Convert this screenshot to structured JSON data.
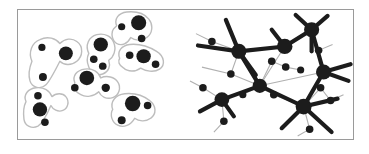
{
  "figure": {
    "title": "",
    "frame": {
      "border_color": "#9a9a9a",
      "background_color": "#ffffff",
      "x": 17,
      "y": 9,
      "width": 337,
      "height": 131
    },
    "panels": [
      {
        "id": "clusters",
        "name": "clustered-nodes-panel",
        "caption": ""
      },
      {
        "id": "network",
        "name": "network-graph-panel",
        "caption": ""
      }
    ]
  },
  "style": {
    "node_color": "#1c1c1c",
    "blob_stroke_color": "#bdbdbd",
    "blob_fill_color": "#ffffff",
    "backbone_edge_color": "#1c1c1c",
    "leaf_edge_color": "#b0b0b0",
    "blob_stroke_width": 1.4,
    "backbone_edge_width": 4.2,
    "leaf_edge_width": 1.1
  },
  "chart_data": {
    "type": "diagram",
    "title": "",
    "subtitle": "",
    "xlabel": "",
    "ylabel": "",
    "panels": [
      {
        "id": "clusters",
        "label": "",
        "description": "Nodes grouped into gray outlined cluster blobs",
        "viewbox": [
          0,
          0,
          168,
          131
        ],
        "clusters": [
          {
            "id": "c1",
            "outline": "M 14,52 C 10,43 14,33 22,30 C 30,26 38,29 42,34 C 47,29 54,28 59,32 C 66,37 65,47 59,52 C 53,57 46,56 42,52 C 38,60 32,72 28,76 C 23,81 14,79 12,72 C 10,65 12,57 14,52 Z",
            "nodes": [
              {
                "cx": 24,
                "cy": 38,
                "r": 3.6
              },
              {
                "cx": 48,
                "cy": 44,
                "r": 7.0
              },
              {
                "cx": 25,
                "cy": 68,
                "r": 4.0
              }
            ]
          },
          {
            "id": "c2",
            "outline": "M 71,44 C 67,36 71,27 79,25 C 87,23 94,27 96,33 C 99,40 96,48 91,51 C 93,57 91,63 85,65 C 79,67 73,64 71,58 C 69,53 69,48 71,44 Z",
            "nodes": [
              {
                "cx": 83,
                "cy": 35,
                "r": 7.2
              },
              {
                "cx": 76,
                "cy": 50,
                "r": 3.8
              },
              {
                "cx": 85,
                "cy": 57,
                "r": 3.8
              }
            ]
          },
          {
            "id": "c3",
            "outline": "M 99,16 C 96,9 101,3 109,2 C 119,1 127,4 131,9 C 136,15 135,24 129,28 C 124,32 117,31 113,28 C 110,34 104,37 99,34 C 94,31 93,23 96,19 Z",
            "nodes": [
              {
                "cx": 121,
                "cy": 13,
                "r": 7.6
              },
              {
                "cx": 104,
                "cy": 17,
                "r": 3.6
              },
              {
                "cx": 124,
                "cy": 29,
                "r": 3.8
              }
            ]
          },
          {
            "id": "c4",
            "outline": "M 102,49 C 99,42 104,36 112,35 C 122,34 131,37 139,42 C 147,47 148,56 142,60 C 136,64 128,62 123,59 C 118,63 110,63 106,59 C 101,56 100,52 102,49 Z",
            "nodes": [
              {
                "cx": 112,
                "cy": 46,
                "r": 3.8
              },
              {
                "cx": 126,
                "cy": 47,
                "r": 7.2
              },
              {
                "cx": 138,
                "cy": 55,
                "r": 3.8
              }
            ]
          },
          {
            "id": "c5",
            "outline": "M 57,74 C 54,67 59,61 67,60 C 75,59 81,63 83,69 C 89,66 97,68 100,73 C 104,79 101,87 95,89 C 89,91 83,88 81,83 C 76,88 68,89 63,86 C 57,83 55,78 57,74 Z",
            "nodes": [
              {
                "cx": 69,
                "cy": 69,
                "r": 7.4
              },
              {
                "cx": 57,
                "cy": 79,
                "r": 3.8
              },
              {
                "cx": 88,
                "cy": 79,
                "r": 4.2
              }
            ]
          },
          {
            "id": "c6",
            "outline": "M 8,93 C 5,86 10,80 18,79 C 26,78 32,82 34,88 C 38,84 45,84 48,88 C 52,93 50,100 45,102 C 40,104 35,101 33,97 C 30,104 25,115 20,118 C 14,121 7,118 6,111 C 5,103 6,97 8,93 Z",
            "nodes": [
              {
                "cx": 20,
                "cy": 87,
                "r": 3.8
              },
              {
                "cx": 22,
                "cy": 101,
                "r": 7.2
              },
              {
                "cx": 27,
                "cy": 114,
                "r": 3.8
              }
            ]
          },
          {
            "id": "c7",
            "outline": "M 95,101 C 92,93 98,86 107,85 C 117,84 126,87 132,92 C 139,97 139,106 133,110 C 128,114 121,113 117,110 C 113,117 106,120 100,117 C 94,114 92,106 95,101 Z",
            "nodes": [
              {
                "cx": 115,
                "cy": 95,
                "r": 7.8
              },
              {
                "cx": 130,
                "cy": 97,
                "r": 3.8
              },
              {
                "cx": 104,
                "cy": 112,
                "r": 4.0
              }
            ]
          }
        ]
      },
      {
        "id": "network",
        "label": "",
        "description": "Backbone network of large hub nodes with thin gray leaf edges",
        "viewbox": [
          0,
          0,
          168,
          131
        ],
        "hub_nodes": [
          {
            "id": "h1",
            "cx": 53,
            "cy": 42,
            "r": 7.6
          },
          {
            "id": "h2",
            "cx": 99,
            "cy": 37,
            "r": 7.8
          },
          {
            "id": "h3",
            "cx": 126,
            "cy": 20,
            "r": 7.6
          },
          {
            "id": "h4",
            "cx": 138,
            "cy": 63,
            "r": 7.6
          },
          {
            "id": "h5",
            "cx": 74,
            "cy": 77,
            "r": 7.2
          },
          {
            "id": "h6",
            "cx": 36,
            "cy": 91,
            "r": 7.4
          },
          {
            "id": "h7",
            "cx": 118,
            "cy": 98,
            "r": 8.0
          }
        ],
        "leaf_nodes": [
          {
            "id": "l1",
            "cx": 26,
            "cy": 32,
            "r": 3.8
          },
          {
            "id": "l2",
            "cx": 86,
            "cy": 52,
            "r": 3.8
          },
          {
            "id": "l3",
            "cx": 100,
            "cy": 58,
            "r": 3.8
          },
          {
            "id": "l4",
            "cx": 115,
            "cy": 61,
            "r": 3.6
          },
          {
            "id": "l5",
            "cx": 133,
            "cy": 41,
            "r": 3.8
          },
          {
            "id": "l6",
            "cx": 45,
            "cy": 65,
            "r": 3.8
          },
          {
            "id": "l7",
            "cx": 17,
            "cy": 79,
            "r": 3.8
          },
          {
            "id": "l8",
            "cx": 57,
            "cy": 86,
            "r": 3.6
          },
          {
            "id": "l9",
            "cx": 88,
            "cy": 86,
            "r": 3.8
          },
          {
            "id": "l10",
            "cx": 38,
            "cy": 113,
            "r": 3.8
          },
          {
            "id": "l11",
            "cx": 135,
            "cy": 79,
            "r": 3.8
          },
          {
            "id": "l12",
            "cx": 145,
            "cy": 92,
            "r": 3.8
          },
          {
            "id": "l13",
            "cx": 124,
            "cy": 121,
            "r": 3.8
          }
        ],
        "backbone_edges": [
          [
            "h1",
            "h2"
          ],
          [
            "h2",
            "h3"
          ],
          [
            "h3",
            "h4"
          ],
          [
            "h1",
            "h5"
          ],
          [
            "h5",
            "h6"
          ],
          [
            "h5",
            "h7"
          ],
          [
            "h4",
            "h7"
          ]
        ],
        "backbone_spurs": [
          {
            "from": "h1",
            "x": 12,
            "y": 36
          },
          {
            "from": "h1",
            "x": 40,
            "y": 10
          },
          {
            "from": "h1",
            "x": 70,
            "y": 66
          },
          {
            "from": "h2",
            "x": 86,
            "y": 20
          },
          {
            "from": "h3",
            "x": 110,
            "y": 5
          },
          {
            "from": "h3",
            "x": 142,
            "y": 6
          },
          {
            "from": "h3",
            "x": 126,
            "y": 42
          },
          {
            "from": "h4",
            "x": 165,
            "y": 55
          },
          {
            "from": "h4",
            "x": 163,
            "y": 72
          },
          {
            "from": "h6",
            "x": 14,
            "y": 103
          },
          {
            "from": "h6",
            "x": 48,
            "y": 108
          },
          {
            "from": "h7",
            "x": 96,
            "y": 120
          },
          {
            "from": "h7",
            "x": 146,
            "y": 124
          },
          {
            "from": "h7",
            "x": 152,
            "y": 90
          }
        ],
        "leaf_edges": [
          [
            "l1",
            "h1"
          ],
          [
            "h1",
            "l6"
          ],
          [
            "l2",
            "h5"
          ],
          [
            "l3",
            "l2"
          ],
          [
            "l4",
            "l3"
          ],
          [
            "l5",
            "h3"
          ],
          [
            "l6",
            "h5"
          ],
          [
            "l7",
            "h6"
          ],
          [
            "l8",
            "h5"
          ],
          [
            "l9",
            "h7"
          ],
          [
            "l10",
            "h6"
          ],
          [
            "l11",
            "h7"
          ],
          [
            "l12",
            "l11"
          ],
          [
            "l13",
            "h7"
          ],
          [
            "h5",
            "h2"
          ],
          [
            "h5",
            "h4"
          ]
        ],
        "leaf_spurs": [
          {
            "from": "l1",
            "x": 10,
            "y": 24
          },
          {
            "from": "l5",
            "x": 147,
            "y": 35
          },
          {
            "from": "l6",
            "x": 16,
            "y": 58
          },
          {
            "from": "l7",
            "x": 4,
            "y": 72
          },
          {
            "from": "l10",
            "x": 28,
            "y": 124
          },
          {
            "from": "l12",
            "x": 158,
            "y": 86
          },
          {
            "from": "l13",
            "x": 112,
            "y": 128
          }
        ]
      }
    ]
  }
}
